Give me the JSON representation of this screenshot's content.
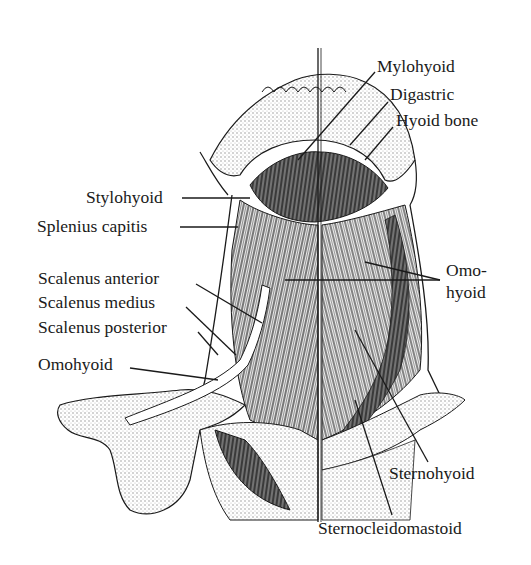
{
  "diagram": {
    "labels": {
      "mylohyoid": "Mylohyoid",
      "digastric": "Digastric",
      "hyoid_bone": "Hyoid bone",
      "stylohyoid": "Stylohyoid",
      "splenius_capitis": "Splenius capitis",
      "scalenus_anterior": "Scalenus anterior",
      "scalenus_medius": "Scalenus medius",
      "scalenus_posterior": "Scalenus posterior",
      "omohyoid_left": "Omohyoid",
      "omohyoid_right_line1": "Omo-",
      "omohyoid_right_line2": "hyoid",
      "sternohyoid": "Sternohyoid",
      "sternocleidomastoid": "Sternocleidomastoid"
    },
    "colors": {
      "ink": "#1a1a1a",
      "background": "#ffffff",
      "shade": "#9a9a9a"
    }
  }
}
